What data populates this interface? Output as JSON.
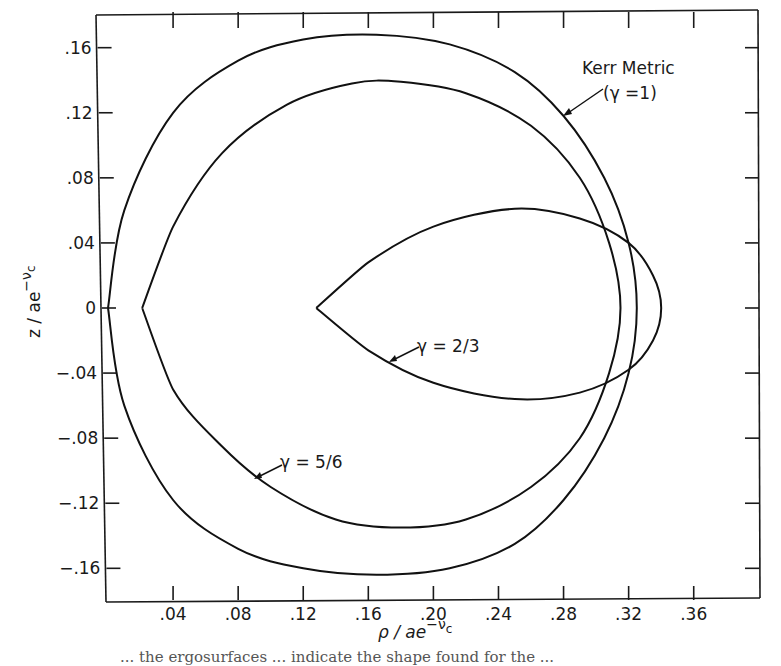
{
  "chart_data": {
    "type": "line",
    "title": "",
    "xlabel": "ρ / ae^(−ν_c)",
    "ylabel": "z / ae^(−ν_c)",
    "xlim": [
      0,
      0.4
    ],
    "ylim": [
      -0.18,
      0.18
    ],
    "x_ticks": [
      ".04",
      ".08",
      ".12",
      ".16",
      ".20",
      ".24",
      ".28",
      ".32",
      ".36"
    ],
    "y_ticks": [
      ".16",
      ".12",
      ".08",
      ".04",
      "0",
      "-.04",
      "-.08",
      "-.12",
      "-.16"
    ],
    "grid": false,
    "legend": "none (inline annotations)",
    "series": [
      {
        "name": "Kerr Metric (γ=1)",
        "shape": "closed curve (ergosurface cross-section)",
        "points": [
          [
            0.0,
            0.0
          ],
          [
            0.01,
            0.06
          ],
          [
            0.04,
            0.12
          ],
          [
            0.08,
            0.152
          ],
          [
            0.12,
            0.165
          ],
          [
            0.165,
            0.168
          ],
          [
            0.21,
            0.162
          ],
          [
            0.25,
            0.145
          ],
          [
            0.28,
            0.118
          ],
          [
            0.305,
            0.08
          ],
          [
            0.32,
            0.04
          ],
          [
            0.325,
            0.0
          ],
          [
            0.32,
            -0.04
          ],
          [
            0.305,
            -0.08
          ],
          [
            0.28,
            -0.118
          ],
          [
            0.25,
            -0.145
          ],
          [
            0.21,
            -0.16
          ],
          [
            0.165,
            -0.164
          ],
          [
            0.12,
            -0.16
          ],
          [
            0.08,
            -0.148
          ],
          [
            0.04,
            -0.118
          ],
          [
            0.01,
            -0.06
          ],
          [
            0.0,
            0.0
          ]
        ]
      },
      {
        "name": "γ = 5/6",
        "shape": "closed curve with cusp on axis",
        "points": [
          [
            0.021,
            0.0
          ],
          [
            0.04,
            0.05
          ],
          [
            0.07,
            0.095
          ],
          [
            0.11,
            0.125
          ],
          [
            0.15,
            0.138
          ],
          [
            0.18,
            0.139
          ],
          [
            0.22,
            0.132
          ],
          [
            0.26,
            0.112
          ],
          [
            0.29,
            0.08
          ],
          [
            0.308,
            0.04
          ],
          [
            0.315,
            0.0
          ],
          [
            0.308,
            -0.04
          ],
          [
            0.29,
            -0.08
          ],
          [
            0.26,
            -0.11
          ],
          [
            0.22,
            -0.13
          ],
          [
            0.18,
            -0.135
          ],
          [
            0.14,
            -0.13
          ],
          [
            0.1,
            -0.11
          ],
          [
            0.07,
            -0.085
          ],
          [
            0.04,
            -0.05
          ],
          [
            0.021,
            0.0
          ]
        ]
      },
      {
        "name": "γ = 2/3",
        "shape": "closed lens-shaped curve with cusp on axis",
        "points": [
          [
            0.128,
            0.0
          ],
          [
            0.16,
            0.028
          ],
          [
            0.2,
            0.05
          ],
          [
            0.25,
            0.061
          ],
          [
            0.29,
            0.055
          ],
          [
            0.32,
            0.04
          ],
          [
            0.335,
            0.02
          ],
          [
            0.34,
            0.0
          ],
          [
            0.335,
            -0.02
          ],
          [
            0.32,
            -0.038
          ],
          [
            0.29,
            -0.052
          ],
          [
            0.25,
            -0.056
          ],
          [
            0.2,
            -0.046
          ],
          [
            0.16,
            -0.026
          ],
          [
            0.128,
            0.0
          ]
        ]
      }
    ],
    "annotations": [
      {
        "text_line1": "Kerr Metric",
        "text_line2": "(γ =1)",
        "arrow_to": [
          0.295,
          0.127
        ]
      },
      {
        "text": "γ = 2/3",
        "arrow_to": [
          0.176,
          -0.03
        ]
      },
      {
        "text": "γ = 5/6",
        "arrow_to": [
          0.09,
          -0.104
        ]
      }
    ]
  },
  "labels": {
    "x_axis_main": "ρ / ae",
    "x_axis_sup": "−ν",
    "x_axis_sub": "c",
    "y_axis_main": "z / ae",
    "y_axis_sup": "−ν",
    "y_axis_sub": "c",
    "kerr_line1": "Kerr Metric",
    "kerr_line2": "(γ =1)",
    "g23": "γ = 2/3",
    "g56": "γ = 5/6",
    "caption": "... the ergosurfaces ... indicate the shape found for the ..."
  }
}
